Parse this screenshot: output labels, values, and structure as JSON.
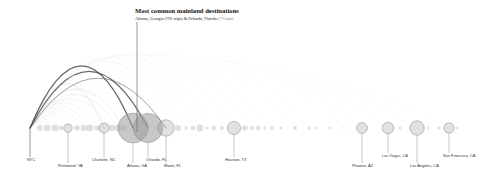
{
  "figure": {
    "background": "#ffffff",
    "baseline_y": 128,
    "origin": {
      "label": "NYC",
      "x": 30,
      "y": 128
    }
  },
  "annotation": {
    "title": "Most common mainland destinations",
    "subtitle_main": "Atlanta, Georgia (791 trips) & Orlando, Florida",
    "subtitle_tail": "(775 trips)",
    "title_x": 135,
    "title_y": 13,
    "leader_from": {
      "x": 137,
      "y": 22
    },
    "leader_to": {
      "x": 137,
      "y": 132
    }
  },
  "colors": {
    "node_fill": "#9a9a9a",
    "node_stroke": "#7a7a7a",
    "arc_dark": "#4a4a4a",
    "arc_light": "#b9b9b9",
    "text": "#333333",
    "title_text": "#111111",
    "leader": "#8a8a8a"
  },
  "chart_data": {
    "type": "arc-diagram",
    "title": "Most common mainland destinations",
    "subtitle": "Atlanta, Georgia (791 trips) & Orlando, Florida (775 trips)",
    "xlabel": "",
    "ylabel": "",
    "grid": false,
    "legend": "none",
    "origin_node": "NYC",
    "value_encoding": "circle radius = number of trips",
    "labeled_nodes": [
      {
        "name": "NYC",
        "x": 30,
        "r": 0,
        "labeled": true,
        "label_dx": -3,
        "label_dy": 33
      },
      {
        "name": "Richmond, VA",
        "x": 68,
        "r": 4.2,
        "labeled": true,
        "label_dx": -10,
        "label_dy": 39
      },
      {
        "name": "Charlotte, NC",
        "x": 104,
        "r": 5.0,
        "labeled": true,
        "label_dx": -12,
        "label_dy": 33
      },
      {
        "name": "Atlanta, GA",
        "x": 133,
        "r": 15.0,
        "labeled": true,
        "label_dx": -6,
        "label_dy": 39
      },
      {
        "name": "Orlando, FL",
        "x": 148,
        "r": 14.6,
        "labeled": true,
        "label_dx": -2,
        "label_dy": 33
      },
      {
        "name": "Miami, FL",
        "x": 166,
        "r": 8.2,
        "labeled": true,
        "label_dx": -2,
        "label_dy": 39
      },
      {
        "name": "Houston, TX",
        "x": 234,
        "r": 6.6,
        "labeled": true,
        "label_dx": -9,
        "label_dy": 33
      },
      {
        "name": "Phoenix, AZ",
        "x": 362,
        "r": 5.4,
        "labeled": true,
        "label_dx": -10,
        "label_dy": 39
      },
      {
        "name": "Las Vegas, CA",
        "x": 388,
        "r": 5.8,
        "labeled": true,
        "label_dx": -6,
        "label_dy": 29
      },
      {
        "name": "Los Angeles, CA",
        "x": 417,
        "r": 7.2,
        "labeled": true,
        "label_dx": -7,
        "label_dy": 39
      },
      {
        "name": "San Francisco, CA",
        "x": 449,
        "r": 5.2,
        "labeled": true,
        "label_dx": -6,
        "label_dy": 29
      }
    ],
    "minor_nodes": [
      {
        "x": 40,
        "r": 3.0
      },
      {
        "x": 47,
        "r": 3.4
      },
      {
        "x": 55,
        "r": 3.6
      },
      {
        "x": 61,
        "r": 2.4
      },
      {
        "x": 77,
        "r": 2.8
      },
      {
        "x": 84,
        "r": 3.3
      },
      {
        "x": 90,
        "r": 3.6
      },
      {
        "x": 97,
        "r": 2.6
      },
      {
        "x": 112,
        "r": 3.2
      },
      {
        "x": 118,
        "r": 3.6
      },
      {
        "x": 124,
        "r": 2.8
      },
      {
        "x": 178,
        "r": 3.0
      },
      {
        "x": 186,
        "r": 1.7
      },
      {
        "x": 193,
        "r": 2.4
      },
      {
        "x": 200,
        "r": 3.4
      },
      {
        "x": 207,
        "r": 1.6
      },
      {
        "x": 214,
        "r": 2.2
      },
      {
        "x": 222,
        "r": 2.0
      },
      {
        "x": 245,
        "r": 2.8
      },
      {
        "x": 252,
        "r": 2.0
      },
      {
        "x": 258,
        "r": 2.4
      },
      {
        "x": 265,
        "r": 1.5
      },
      {
        "x": 272,
        "r": 1.9
      },
      {
        "x": 281,
        "r": 1.4
      },
      {
        "x": 295,
        "r": 2.0
      },
      {
        "x": 309,
        "r": 1.7
      },
      {
        "x": 316,
        "r": 1.2
      },
      {
        "x": 330,
        "r": 1.3
      },
      {
        "x": 344,
        "r": 1.0
      },
      {
        "x": 400,
        "r": 1.5
      },
      {
        "x": 428,
        "r": 1.6
      },
      {
        "x": 439,
        "r": 1.8
      },
      {
        "x": 457,
        "r": 1.3
      }
    ],
    "arcs": [
      {
        "to": 133,
        "height": 92,
        "weight": 1.0,
        "opacity": 0.85
      },
      {
        "to": 148,
        "height": 84,
        "weight": 0.98,
        "opacity": 0.82
      },
      {
        "to": 166,
        "height": 74,
        "weight": 0.62,
        "opacity": 0.55
      },
      {
        "to": 104,
        "height": 66,
        "weight": 0.42,
        "opacity": 0.4
      },
      {
        "to": 124,
        "height": 58,
        "weight": 0.36,
        "opacity": 0.34
      },
      {
        "to": 118,
        "height": 50,
        "weight": 0.3,
        "opacity": 0.3
      },
      {
        "to": 112,
        "height": 44,
        "weight": 0.26,
        "opacity": 0.26
      },
      {
        "to": 97,
        "height": 38,
        "weight": 0.24,
        "opacity": 0.24
      },
      {
        "to": 90,
        "height": 32,
        "weight": 0.22,
        "opacity": 0.22
      },
      {
        "to": 84,
        "height": 27,
        "weight": 0.2,
        "opacity": 0.2
      },
      {
        "to": 77,
        "height": 22,
        "weight": 0.18,
        "opacity": 0.19
      },
      {
        "to": 68,
        "height": 18,
        "weight": 0.18,
        "opacity": 0.18
      },
      {
        "to": 61,
        "height": 14,
        "weight": 0.16,
        "opacity": 0.17
      },
      {
        "to": 55,
        "height": 11,
        "weight": 0.15,
        "opacity": 0.16
      },
      {
        "to": 47,
        "height": 8,
        "weight": 0.14,
        "opacity": 0.15
      },
      {
        "to": 40,
        "height": 5,
        "weight": 0.13,
        "opacity": 0.14
      },
      {
        "to": 178,
        "height": 100,
        "weight": 0.22,
        "opacity": 0.2
      },
      {
        "to": 186,
        "height": 104,
        "weight": 0.16,
        "opacity": 0.15
      },
      {
        "to": 200,
        "height": 106,
        "weight": 0.16,
        "opacity": 0.14
      },
      {
        "to": 214,
        "height": 108,
        "weight": 0.14,
        "opacity": 0.12
      },
      {
        "to": 234,
        "height": 110,
        "weight": 0.22,
        "opacity": 0.18
      },
      {
        "to": 252,
        "height": 110,
        "weight": 0.12,
        "opacity": 0.1
      },
      {
        "to": 272,
        "height": 110,
        "weight": 0.11,
        "opacity": 0.09
      },
      {
        "to": 295,
        "height": 110,
        "weight": 0.1,
        "opacity": 0.08
      },
      {
        "to": 316,
        "height": 108,
        "weight": 0.09,
        "opacity": 0.07
      },
      {
        "to": 344,
        "height": 106,
        "weight": 0.08,
        "opacity": 0.06
      },
      {
        "to": 362,
        "height": 104,
        "weight": 0.12,
        "opacity": 0.09
      },
      {
        "to": 388,
        "height": 100,
        "weight": 0.12,
        "opacity": 0.09
      },
      {
        "to": 417,
        "height": 94,
        "weight": 0.14,
        "opacity": 0.1
      },
      {
        "to": 449,
        "height": 86,
        "weight": 0.11,
        "opacity": 0.08
      }
    ]
  }
}
